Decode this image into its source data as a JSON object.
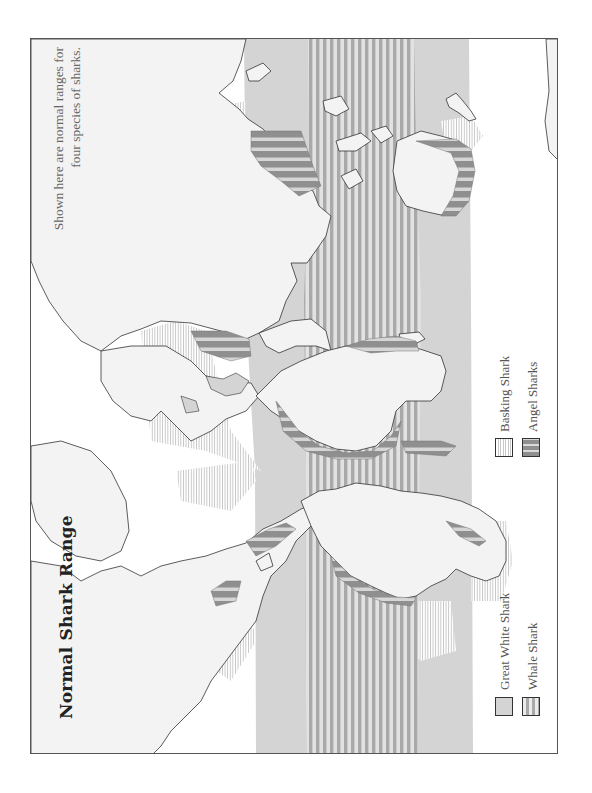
{
  "title": "Normal Shark Range",
  "subtitle": {
    "line1": "Shown here are normal ranges for",
    "line2": "four species of sharks."
  },
  "legend": {
    "items": [
      {
        "label": "Great White Shark",
        "pattern": "solid-gray",
        "color": "#d4d4d4"
      },
      {
        "label": "Whale Shark",
        "pattern": "vertical-stripes",
        "color": "#a9a9a9"
      },
      {
        "label": "Basking Shark",
        "pattern": "fine-vertical-hatch",
        "color": "#c8c8c8"
      },
      {
        "label": "Angel Sharks",
        "pattern": "horizontal-stripes",
        "color": "#8f8f8f"
      }
    ]
  },
  "colors": {
    "land": "#f3f3f3",
    "coast": "#333333",
    "ocean": "#ffffff",
    "great_white": "#d4d4d4",
    "whale_dark": "#a9a9a9",
    "angel_dark": "#8f8f8f"
  },
  "map": {
    "orientation": "rotated 90° (north at left, east at top)",
    "regions": [
      "Eurasia",
      "Africa",
      "Europe",
      "North America",
      "South America",
      "Australia",
      "Greenland",
      "New Zealand",
      "Madagascar",
      "Arabia"
    ]
  }
}
